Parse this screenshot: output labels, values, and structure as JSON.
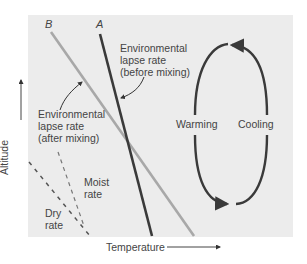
{
  "diagram": {
    "axes": {
      "x_label": "Temperature",
      "y_label": "Altitude"
    },
    "lines": {
      "a": {
        "name": "A",
        "color": "#3a3a3a"
      },
      "b": {
        "name": "B",
        "color": "#a8a8a8"
      }
    },
    "labels": {
      "before_mixing": [
        "Environmental",
        "lapse rate",
        "(before mixing)"
      ],
      "after_mixing": [
        "Environmental",
        "lapse rate",
        "(after mixing)"
      ],
      "moist_rate": [
        "Moist",
        "rate"
      ],
      "dry_rate": [
        "Dry",
        "rate"
      ],
      "warming": "Warming",
      "cooling": "Cooling"
    },
    "colors": {
      "panel": "#ececec",
      "dark_line": "#3a3a3a",
      "light_line": "#a8a8a8",
      "text": "#444444"
    }
  }
}
